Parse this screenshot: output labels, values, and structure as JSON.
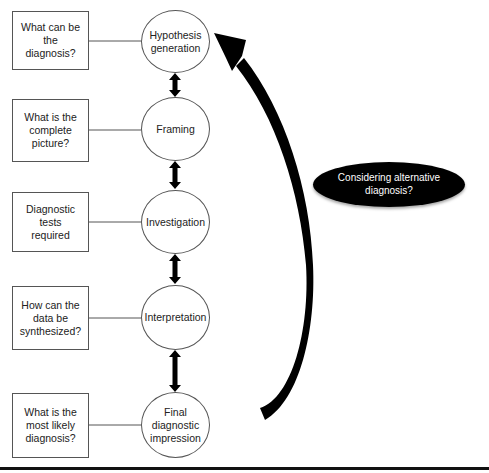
{
  "diagram": {
    "steps": [
      {
        "node": "Hypothesis generation",
        "question": "What can be the diagnosis?"
      },
      {
        "node": "Framing",
        "question": "What is the complete picture?"
      },
      {
        "node": "Investigation",
        "question": "Diagnostic tests required"
      },
      {
        "node": "Interpretation",
        "question": "How can the data be synthesized?"
      },
      {
        "node": "Final diagnostic impression",
        "question": "What is the most likely diagnosis?"
      }
    ],
    "feedback_label": "Considering alternative diagnosis?",
    "colors": {
      "stroke": "#555555",
      "arrow": "#000000",
      "ellipse_fill": "#000000",
      "ellipse_text": "#ffffff"
    }
  }
}
